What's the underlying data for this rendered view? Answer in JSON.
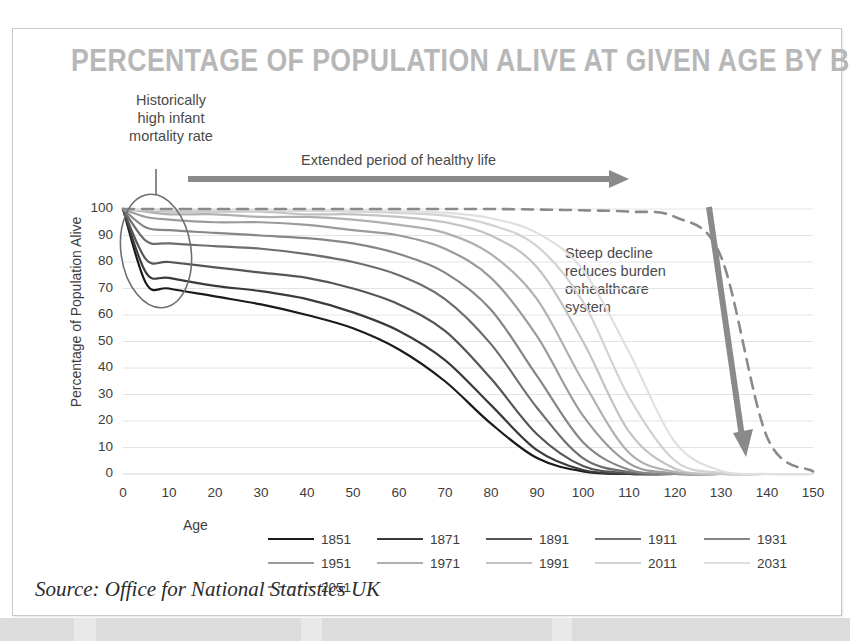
{
  "card": {
    "title": "PERCENTAGE OF POPULATION ALIVE AT GIVEN AGE BY BIRTH YEAR",
    "source": "Source: Office for National Statistics UK"
  },
  "annotations": {
    "infant_mortality": "Historically\nhigh infant\nmortality rate",
    "extended_period": "Extended period of healthy life",
    "steep_decline": "Steep decline\nreduces burden\nonhealthcare\nsystem"
  },
  "colors": {
    "title": "#b7b7b7",
    "card_border": "#c9c9c9",
    "grid": "#e4e4e4",
    "annotation_arrow": "#8a8a8a",
    "ellipse": "#6f6f6f",
    "text": "#3d3d3d",
    "background": "#ffffff"
  },
  "chart_data": {
    "type": "line",
    "title": "PERCENTAGE OF POPULATION ALIVE AT GIVEN AGE BY BIRTH YEAR",
    "xlabel": "Age",
    "ylabel": "Percentage of Population Alive",
    "xlim": [
      0,
      150
    ],
    "ylim": [
      0,
      100
    ],
    "xticks": [
      0,
      10,
      20,
      30,
      40,
      50,
      60,
      70,
      80,
      90,
      100,
      110,
      120,
      130,
      140,
      150
    ],
    "yticks": [
      0,
      10,
      20,
      30,
      40,
      50,
      60,
      70,
      80,
      90,
      100
    ],
    "grid": true,
    "legend_position": "bottom",
    "x": [
      0,
      5,
      10,
      20,
      30,
      40,
      50,
      60,
      70,
      80,
      90,
      100,
      110,
      120,
      130,
      140,
      150
    ],
    "series": [
      {
        "name": "1851",
        "color": "#1a1a1a",
        "style": "solid",
        "values": [
          100,
          72,
          70,
          67,
          64,
          60,
          55,
          47,
          35,
          19,
          6,
          1,
          0,
          0,
          0,
          0,
          0
        ]
      },
      {
        "name": "1871",
        "color": "#3a3a3a",
        "style": "solid",
        "values": [
          100,
          76,
          74,
          71,
          69,
          66,
          61,
          54,
          43,
          26,
          9,
          1.5,
          0,
          0,
          0,
          0,
          0
        ]
      },
      {
        "name": "1891",
        "color": "#555555",
        "style": "solid",
        "values": [
          100,
          81,
          80,
          78,
          76,
          74,
          70,
          64,
          54,
          36,
          15,
          3,
          0.3,
          0,
          0,
          0,
          0
        ]
      },
      {
        "name": "1911",
        "color": "#6d6d6d",
        "style": "solid",
        "values": [
          100,
          88,
          87,
          86,
          85,
          83,
          80,
          75,
          66,
          49,
          25,
          6,
          0.7,
          0,
          0,
          0,
          0
        ]
      },
      {
        "name": "1931",
        "color": "#868686",
        "style": "solid",
        "values": [
          100,
          93,
          92,
          91,
          90,
          89,
          87,
          83,
          76,
          62,
          37,
          12,
          1.6,
          0,
          0,
          0,
          0
        ]
      },
      {
        "name": "1951",
        "color": "#9b9b9b",
        "style": "solid",
        "values": [
          100,
          97,
          96,
          95,
          95,
          94,
          92,
          90,
          85,
          74,
          52,
          22,
          4,
          0.3,
          0,
          0,
          0
        ]
      },
      {
        "name": "1971",
        "color": "#b0b0b0",
        "style": "solid",
        "values": [
          100,
          99,
          98,
          98,
          97,
          97,
          96,
          94,
          91,
          83,
          66,
          35,
          8,
          0.8,
          0,
          0,
          0
        ]
      },
      {
        "name": "1991",
        "color": "#c2c2c2",
        "style": "solid",
        "values": [
          100,
          99.5,
          99,
          99,
          99,
          98,
          98,
          97,
          95,
          90,
          78,
          50,
          16,
          2,
          0,
          0,
          0
        ]
      },
      {
        "name": "2011",
        "color": "#d2d2d2",
        "style": "solid",
        "values": [
          100,
          99.8,
          99.6,
          99.5,
          99.4,
          99.3,
          99,
          98.5,
          97.5,
          94,
          86,
          65,
          29,
          5,
          0.4,
          0,
          0
        ]
      },
      {
        "name": "2031",
        "color": "#e0e0e0",
        "style": "solid",
        "values": [
          100,
          99.9,
          99.8,
          99.8,
          99.7,
          99.6,
          99.5,
          99.2,
          98.6,
          96.5,
          91,
          77,
          46,
          12,
          1.2,
          0,
          0
        ]
      },
      {
        "name": "2051",
        "color": "#8a8a8a",
        "style": "dashed",
        "values": [
          100,
          100,
          100,
          100,
          100,
          100,
          100,
          100,
          100,
          100,
          99.8,
          99.5,
          99,
          97,
          82,
          14,
          1
        ]
      }
    ]
  }
}
